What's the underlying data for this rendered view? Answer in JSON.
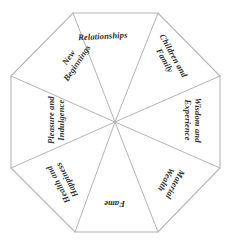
{
  "diagram": {
    "type": "octagon-wheel",
    "shape_name": "octagon",
    "sector_count": 8,
    "stroke_color": "#b4b4b4",
    "fill_color": "#ffffff",
    "text_color": "#2e2e2e",
    "background_color": "#ffffff",
    "geometry": {
      "center_x": 115,
      "center_y": 122,
      "vertices": [
        [
          73,
          13
        ],
        [
          158,
          13
        ],
        [
          220,
          76
        ],
        [
          220,
          168
        ],
        [
          158,
          232
        ],
        [
          75,
          232
        ],
        [
          11,
          168
        ],
        [
          11,
          76
        ]
      ]
    },
    "sectors": [
      {
        "id": "relationships",
        "label": "Relationships",
        "lines": [
          "Relationships"
        ],
        "position": "top",
        "rotation_deg": 0
      },
      {
        "id": "children-and-family",
        "label": "Children and Family",
        "lines": [
          "Children and",
          "Family"
        ],
        "position": "top-right",
        "rotation_deg": 45
      },
      {
        "id": "wisdom-and-experience",
        "label": "Wisdom and Experience",
        "lines": [
          "Wisdom and",
          "Experience"
        ],
        "position": "right",
        "rotation_deg": 90
      },
      {
        "id": "material-wealth",
        "label": "Material Wealth",
        "lines": [
          "Material",
          "Wealth"
        ],
        "position": "bottom-right",
        "rotation_deg": 135
      },
      {
        "id": "fame",
        "label": "Fame",
        "lines": [
          "Fame"
        ],
        "position": "bottom",
        "rotation_deg": 180
      },
      {
        "id": "health-and-happiness",
        "label": "Health and Happiness",
        "lines": [
          "Health and",
          "Happiness"
        ],
        "position": "bottom-left",
        "rotation_deg": 225
      },
      {
        "id": "pleasure-and-indulgence",
        "label": "Pleasure and Indulgence",
        "lines": [
          "Pleasure and",
          "Indulgence"
        ],
        "position": "left",
        "rotation_deg": 270
      },
      {
        "id": "new-beginnings",
        "label": "New Beginnings",
        "lines": [
          "New",
          "Beginnings"
        ],
        "position": "top-left",
        "rotation_deg": 315
      }
    ]
  }
}
